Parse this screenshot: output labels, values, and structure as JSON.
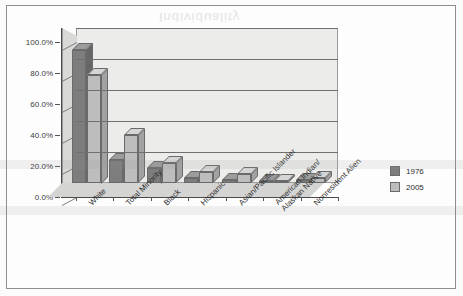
{
  "frame": {
    "border_color": "#8e8e8e"
  },
  "watermark": {
    "text": "Individuality"
  },
  "legend": {
    "position": "right",
    "entries": [
      {
        "label": "1976",
        "color": "#7d7d7d"
      },
      {
        "label": "2005",
        "color": "#bdbdbd"
      }
    ]
  },
  "chart_data": {
    "type": "bar",
    "title": "",
    "subtitle": "",
    "xlabel": "",
    "ylabel": "",
    "ylim": [
      0,
      100
    ],
    "grid": true,
    "legend_position": "right",
    "style": "3d-clustered-column",
    "ytick_labels": [
      "0.0%",
      "20.0%",
      "40.0%",
      "60.0%",
      "80.0%",
      "100.0%"
    ],
    "ytick_values": [
      0,
      20,
      40,
      60,
      80,
      100
    ],
    "categories": [
      "White",
      "Total Minority",
      "Black",
      "Hispanic",
      "Asian/Pacific Islander",
      "American Indian/\nAlaskan Native",
      "Nonresident Alien"
    ],
    "category_labels": [
      {
        "line1": "White",
        "line2": ""
      },
      {
        "line1": "Total Minority",
        "line2": ""
      },
      {
        "line1": "Black",
        "line2": ""
      },
      {
        "line1": "Hispanic",
        "line2": ""
      },
      {
        "line1": "Asian/Pacific Islander",
        "line2": ""
      },
      {
        "line1": "American Indian/",
        "line2": "Alaskan Native"
      },
      {
        "line1": "Nonresident Alien",
        "line2": ""
      }
    ],
    "series": [
      {
        "name": "1976",
        "color": "#7d7d7d",
        "values": [
          86.0,
          15.0,
          10.0,
          3.5,
          2.0,
          0.7,
          2.0
        ]
      },
      {
        "name": "2005",
        "color": "#bdbdbd",
        "values": [
          70.0,
          31.0,
          13.0,
          7.0,
          6.0,
          1.0,
          3.0
        ]
      }
    ]
  }
}
